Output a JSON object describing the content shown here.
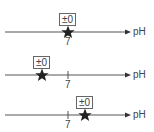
{
  "diagram": {
    "type": "ph-number-lines",
    "axis_label": "pH",
    "reference_tick": "7",
    "line_color": "#555555",
    "star_color": "#222222",
    "rows": [
      {
        "id": "row-neutral",
        "badge": "±0",
        "star_position": "at 7"
      },
      {
        "id": "row-acidic",
        "badge": "±0",
        "star_position": "left of 7"
      },
      {
        "id": "row-basic",
        "badge": "±0",
        "star_position": "right of 7"
      }
    ]
  }
}
